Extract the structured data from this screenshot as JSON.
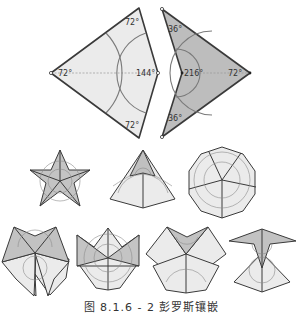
{
  "figure": {
    "caption": "图 8.1.6 - 2 彭罗斯镶嵌",
    "colors": {
      "kite_fill": "#ebebeb",
      "dart_fill": "#bdbdbd",
      "edge": "#3a3a3a",
      "arc": "#7a7a7a"
    },
    "kite": {
      "name": "kite",
      "angles": {
        "left": "72°",
        "top": "72°",
        "right": "144°",
        "bottom": "72°"
      }
    },
    "dart": {
      "name": "dart",
      "angles": {
        "top": "36°",
        "inner": "216°",
        "right": "72°",
        "bottom": "36°"
      }
    },
    "vertex_configurations": [
      {
        "id": "star",
        "row": 1
      },
      {
        "id": "ace",
        "row": 1
      },
      {
        "id": "sun",
        "row": 1
      },
      {
        "id": "king",
        "row": 2
      },
      {
        "id": "queen",
        "row": 2
      },
      {
        "id": "jack",
        "row": 2
      },
      {
        "id": "deuce",
        "row": 2
      }
    ]
  }
}
